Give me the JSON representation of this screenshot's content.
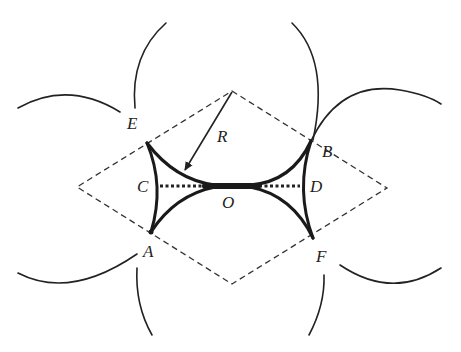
{
  "figure": {
    "colors": {
      "ink": "#222222",
      "background": "#ffffff"
    },
    "labels": {
      "E": "E",
      "B": "B",
      "C": "C",
      "D": "D",
      "O": "O",
      "A": "A",
      "F": "F",
      "R": "R"
    },
    "elements": {
      "rhombus": "dashed rhombus",
      "radius_arrow": "radius arrow labelled R",
      "center_line": "dotted line C to D through O",
      "neck_boundary": "bold concave boundary curves",
      "outer_circles": "six partial circles"
    }
  }
}
